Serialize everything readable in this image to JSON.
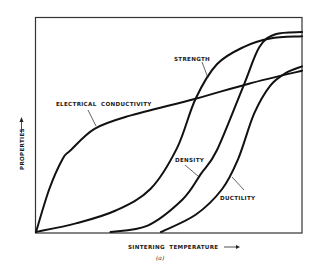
{
  "chart_data": {
    "type": "line",
    "title": "",
    "caption": "(a)",
    "xlabel": "SINTERING TEMPERATURE",
    "ylabel": "PROPERTIES",
    "xlim": [
      0,
      1
    ],
    "ylim": [
      0,
      1
    ],
    "grid": false,
    "legend": "inline labels",
    "ticks": "none (qualitative axes with arrows)",
    "series": [
      {
        "name": "ELECTRICAL CONDUCTIVITY",
        "x": [
          0.0,
          0.05,
          0.1,
          0.13,
          0.22,
          0.35,
          0.6,
          0.8,
          1.0
        ],
        "y": [
          0.0,
          0.2,
          0.34,
          0.38,
          0.48,
          0.54,
          0.62,
          0.69,
          0.75
        ]
      },
      {
        "name": "STRENGTH",
        "x": [
          0.0,
          0.15,
          0.3,
          0.43,
          0.53,
          0.6,
          0.68,
          0.78,
          0.88,
          1.0
        ],
        "y": [
          0.0,
          0.04,
          0.1,
          0.2,
          0.39,
          0.62,
          0.78,
          0.86,
          0.9,
          0.91
        ]
      },
      {
        "name": "DENSITY",
        "x": [
          0.28,
          0.42,
          0.55,
          0.62,
          0.68,
          0.78,
          0.84,
          0.9,
          1.0
        ],
        "y": [
          0.0,
          0.03,
          0.15,
          0.27,
          0.38,
          0.68,
          0.86,
          0.92,
          0.93
        ]
      },
      {
        "name": "DUCTILITY",
        "x": [
          0.47,
          0.6,
          0.7,
          0.76,
          0.82,
          0.88,
          0.94,
          1.0
        ],
        "y": [
          0.0,
          0.08,
          0.2,
          0.34,
          0.55,
          0.68,
          0.74,
          0.77
        ]
      }
    ]
  },
  "labels": {
    "electrical_conductivity": "ELECTRICAL  CONDUCTIVITY",
    "strength": "STRENGTH",
    "density": "DENSITY",
    "ductility": "DUCTILITY",
    "x_axis": "SINTERING  TEMPERATURE",
    "y_axis": "PROPERTIES",
    "caption": "(a)"
  }
}
